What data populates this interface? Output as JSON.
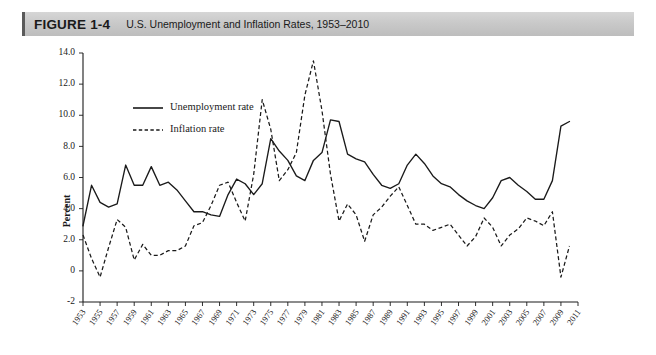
{
  "header": {
    "figure_label": "FIGURE 1-4",
    "title": "U.S. Unemployment and Inflation Rates, 1953–2010",
    "bar_color": "#c9c9c9",
    "accent_color": "#5a5a5a"
  },
  "chart_data": {
    "type": "line",
    "title": "U.S. Unemployment and Inflation Rates, 1953–2010",
    "xlabel": "",
    "ylabel": "Percent",
    "xlim": [
      1953,
      2011
    ],
    "ylim": [
      -2,
      14
    ],
    "yticks": [
      -2,
      0,
      2,
      4,
      6,
      8,
      10,
      12,
      14
    ],
    "ytick_labels": [
      "-2",
      "0",
      "2.0",
      "4.0",
      "6.0",
      "8.0",
      "10.0",
      "12.0",
      "14.0"
    ],
    "xticks": [
      1953,
      1955,
      1957,
      1959,
      1961,
      1963,
      1965,
      1967,
      1969,
      1971,
      1973,
      1975,
      1977,
      1979,
      1981,
      1983,
      1985,
      1987,
      1989,
      1991,
      1993,
      1995,
      1997,
      1999,
      2001,
      2003,
      2005,
      2007,
      2009,
      2011
    ],
    "xtick_labels": [
      "1953",
      "1955",
      "1957",
      "1959",
      "1961",
      "1963",
      "1965",
      "1967",
      "1969",
      "1971",
      "1973",
      "1975",
      "1977",
      "1979",
      "1981",
      "1983",
      "1985",
      "1987",
      "1989",
      "1991",
      "1993",
      "1995",
      "1997",
      "1999",
      "2001",
      "2003",
      "2005",
      "2007",
      "2009",
      "2011"
    ],
    "grid": false,
    "legend_position": "upper-left",
    "x": [
      1953,
      1954,
      1955,
      1956,
      1957,
      1958,
      1959,
      1960,
      1961,
      1962,
      1963,
      1964,
      1965,
      1966,
      1967,
      1968,
      1969,
      1970,
      1971,
      1972,
      1973,
      1974,
      1975,
      1976,
      1977,
      1978,
      1979,
      1980,
      1981,
      1982,
      1983,
      1984,
      1985,
      1986,
      1987,
      1988,
      1989,
      1990,
      1991,
      1992,
      1993,
      1994,
      1995,
      1996,
      1997,
      1998,
      1999,
      2000,
      2001,
      2002,
      2003,
      2004,
      2005,
      2006,
      2007,
      2008,
      2009,
      2010
    ],
    "series": [
      {
        "name": "Unemployment rate",
        "style": "solid",
        "color": "#1a1a1a",
        "values": [
          2.9,
          5.5,
          4.4,
          4.1,
          4.3,
          6.8,
          5.5,
          5.5,
          6.7,
          5.5,
          5.7,
          5.2,
          4.5,
          3.8,
          3.8,
          3.6,
          3.5,
          4.9,
          5.9,
          5.6,
          4.9,
          5.6,
          8.5,
          7.7,
          7.1,
          6.1,
          5.8,
          7.1,
          7.6,
          9.7,
          9.6,
          7.5,
          7.2,
          7.0,
          6.2,
          5.5,
          5.3,
          5.6,
          6.8,
          7.5,
          6.9,
          6.1,
          5.6,
          5.4,
          4.9,
          4.5,
          4.2,
          4.0,
          4.7,
          5.8,
          6.0,
          5.5,
          5.1,
          4.6,
          4.6,
          5.8,
          9.3,
          9.6
        ]
      },
      {
        "name": "Inflation rate",
        "style": "dashed",
        "color": "#1a1a1a",
        "values": [
          2.3,
          0.8,
          -0.4,
          1.5,
          3.3,
          2.8,
          0.7,
          1.7,
          1.0,
          1.0,
          1.3,
          1.3,
          1.6,
          2.9,
          3.1,
          4.2,
          5.5,
          5.7,
          4.4,
          3.2,
          6.2,
          11.0,
          9.1,
          5.8,
          6.5,
          7.6,
          11.3,
          13.5,
          10.3,
          6.2,
          3.2,
          4.3,
          3.6,
          1.9,
          3.6,
          4.1,
          4.8,
          5.4,
          4.2,
          3.0,
          3.0,
          2.6,
          2.8,
          3.0,
          2.3,
          1.6,
          2.2,
          3.4,
          2.8,
          1.6,
          2.3,
          2.7,
          3.4,
          3.2,
          2.9,
          3.8,
          -0.4,
          1.6
        ]
      }
    ],
    "legend": [
      "Unemployment rate",
      "Inflation rate"
    ]
  }
}
